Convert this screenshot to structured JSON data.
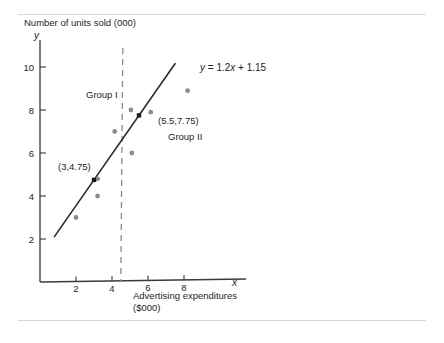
{
  "chart_data": {
    "type": "scatter",
    "title": "Number of units sold (000)",
    "xlabel_line1": "Advertising expenditures",
    "xlabel_line2": "($000)",
    "x_axis_symbol": "x",
    "y_axis_symbol": "y",
    "xlim": [
      0,
      9.2
    ],
    "ylim": [
      0,
      11.2
    ],
    "x_ticks": [
      2,
      4,
      6,
      8
    ],
    "y_ticks": [
      2,
      4,
      6,
      8,
      10
    ],
    "grid": false,
    "legend": "none",
    "points": [
      {
        "x": 2.0,
        "y": 3.0
      },
      {
        "x": 3.2,
        "y": 4.0
      },
      {
        "x": 3.2,
        "y": 4.8
      },
      {
        "x": 4.15,
        "y": 7.0
      },
      {
        "x": 5.05,
        "y": 8.0
      },
      {
        "x": 5.1,
        "y": 6.0
      },
      {
        "x": 6.15,
        "y": 7.9
      },
      {
        "x": 8.2,
        "y": 8.9
      }
    ],
    "fit_line": {
      "equation": "y = 1.2x + 1.15",
      "equation_parts": {
        "y": "y",
        "rest_1": " =  1.2",
        "x": "x",
        "rest_2": " +  1.15"
      },
      "slope": 1.2,
      "intercept": 1.15,
      "x_start": 0.8,
      "x_end": 7.5
    },
    "marked_points": [
      {
        "label": "(3,4.75)",
        "x": 3.0,
        "y": 4.75
      },
      {
        "label": "(5.5,7.75)",
        "x": 5.5,
        "y": 7.75
      }
    ],
    "divider": {
      "type": "vertical-dashed",
      "x": 4.6
    },
    "annotations": [
      {
        "name": "group-1",
        "text": "Group I",
        "x": 2.6,
        "y": 9.0
      },
      {
        "name": "group-2",
        "text": "Group II",
        "x": 7.1,
        "y": 7.0
      }
    ],
    "colors": {
      "axis": "#3a3a3a",
      "line": "#2a2a2a",
      "point": "#8c8c8c",
      "divider": "#8a8a8a",
      "text": "#1e1e1e"
    }
  }
}
